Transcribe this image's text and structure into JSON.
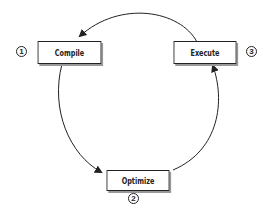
{
  "diagram": {
    "type": "cycle",
    "nodes": [
      {
        "id": "compile",
        "label": "Compile",
        "step": "1"
      },
      {
        "id": "optimize",
        "label": "Optimize",
        "step": "2"
      },
      {
        "id": "execute",
        "label": "Execute",
        "step": "3"
      }
    ],
    "edges": [
      {
        "from": "compile",
        "to": "optimize"
      },
      {
        "from": "optimize",
        "to": "execute"
      },
      {
        "from": "execute",
        "to": "compile"
      }
    ],
    "colors": {
      "stroke": "#222222",
      "shadow": "#999999",
      "background": "#ffffff"
    }
  }
}
